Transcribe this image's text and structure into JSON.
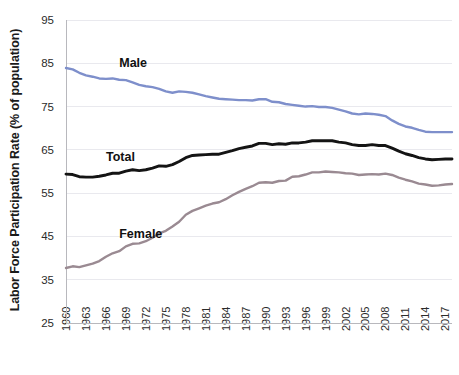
{
  "chart_data": {
    "type": "line",
    "title": "",
    "subtitle": "",
    "xlabel": "",
    "ylabel": "Labor Force Participation Rate (% of population)",
    "xlim": [
      1960,
      2018
    ],
    "ylim": [
      25,
      95
    ],
    "yticks": [
      25,
      35,
      45,
      55,
      65,
      75,
      85,
      95
    ],
    "xticks": [
      1960,
      1963,
      1966,
      1969,
      1972,
      1975,
      1978,
      1981,
      1984,
      1987,
      1990,
      1993,
      1996,
      1999,
      2002,
      2005,
      2008,
      2011,
      2014,
      2017
    ],
    "grid": true,
    "grid_axis": "y",
    "legend": "inline-annotations",
    "legend_position": "inline",
    "x": [
      1960,
      1961,
      1962,
      1963,
      1964,
      1965,
      1966,
      1967,
      1968,
      1969,
      1970,
      1971,
      1972,
      1973,
      1974,
      1975,
      1976,
      1977,
      1978,
      1979,
      1980,
      1981,
      1982,
      1983,
      1984,
      1985,
      1986,
      1987,
      1988,
      1989,
      1990,
      1991,
      1992,
      1993,
      1994,
      1995,
      1996,
      1997,
      1998,
      1999,
      2000,
      2001,
      2002,
      2003,
      2004,
      2005,
      2006,
      2007,
      2008,
      2009,
      2010,
      2011,
      2012,
      2013,
      2014,
      2015,
      2016,
      2017,
      2018
    ],
    "series": [
      {
        "name": "Male",
        "color": "#7e8fcb",
        "label_x": 1968,
        "label_y": 84.2,
        "values": [
          83.9,
          83.6,
          82.8,
          82.2,
          81.9,
          81.5,
          81.4,
          81.5,
          81.2,
          81.1,
          80.6,
          80.0,
          79.7,
          79.5,
          79.1,
          78.5,
          78.2,
          78.5,
          78.4,
          78.2,
          77.8,
          77.4,
          77.1,
          76.8,
          76.7,
          76.6,
          76.5,
          76.5,
          76.4,
          76.7,
          76.7,
          76.1,
          76.0,
          75.6,
          75.4,
          75.2,
          75.0,
          75.1,
          74.9,
          74.9,
          74.7,
          74.3,
          73.9,
          73.4,
          73.2,
          73.4,
          73.3,
          73.1,
          72.8,
          71.8,
          71.0,
          70.4,
          70.1,
          69.6,
          69.2,
          69.1,
          69.1,
          69.1,
          69.1
        ]
      },
      {
        "name": "Total",
        "color": "#141414",
        "label_x": 1966,
        "label_y": 62.4,
        "values": [
          59.4,
          59.3,
          58.8,
          58.7,
          58.7,
          58.9,
          59.2,
          59.6,
          59.6,
          60.1,
          60.4,
          60.2,
          60.4,
          60.8,
          61.3,
          61.2,
          61.6,
          62.3,
          63.2,
          63.7,
          63.8,
          63.9,
          64.0,
          64.0,
          64.4,
          64.8,
          65.3,
          65.6,
          65.9,
          66.5,
          66.5,
          66.2,
          66.4,
          66.3,
          66.6,
          66.6,
          66.8,
          67.1,
          67.1,
          67.1,
          67.1,
          66.8,
          66.6,
          66.2,
          66.0,
          66.0,
          66.2,
          66.0,
          66.0,
          65.4,
          64.7,
          64.1,
          63.7,
          63.2,
          62.9,
          62.7,
          62.8,
          62.9,
          62.9
        ]
      },
      {
        "name": "Female",
        "color": "#9a8a92",
        "label_x": 1968,
        "label_y": 44.6,
        "values": [
          37.7,
          38.1,
          37.9,
          38.3,
          38.7,
          39.3,
          40.3,
          41.1,
          41.6,
          42.7,
          43.3,
          43.4,
          43.9,
          44.7,
          45.7,
          46.3,
          47.3,
          48.4,
          50.0,
          50.9,
          51.5,
          52.1,
          52.6,
          52.9,
          53.6,
          54.5,
          55.3,
          56.0,
          56.6,
          57.4,
          57.5,
          57.4,
          57.8,
          57.9,
          58.8,
          58.9,
          59.3,
          59.8,
          59.8,
          60.0,
          59.9,
          59.8,
          59.6,
          59.5,
          59.2,
          59.3,
          59.4,
          59.3,
          59.5,
          59.2,
          58.6,
          58.1,
          57.7,
          57.2,
          57.0,
          56.7,
          56.8,
          57.0,
          57.1
        ]
      }
    ]
  }
}
